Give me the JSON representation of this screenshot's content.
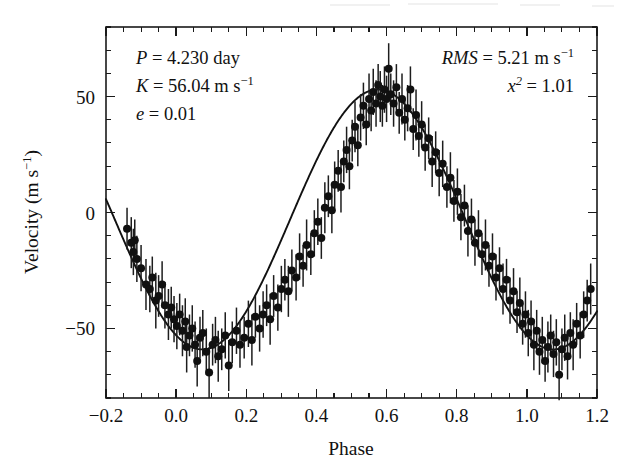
{
  "figure": {
    "background_color": "#ffffff",
    "ink_color": "#111111"
  },
  "annotations": {
    "left_block": [
      {
        "id": "period",
        "symbol": "P",
        "equals": "=",
        "value": "4.230",
        "unit": "day"
      },
      {
        "id": "semi-amplitude",
        "symbol": "K",
        "equals": "=",
        "value": "56.04",
        "unit": "m s",
        "unit_exp": "−1"
      },
      {
        "id": "eccentricity",
        "symbol": "e",
        "equals": "=",
        "value": "0.01",
        "unit": ""
      }
    ],
    "right_block": [
      {
        "id": "rms",
        "symbol": "RMS",
        "equals": "=",
        "value": "5.21",
        "unit": "m s",
        "unit_exp": "−1"
      },
      {
        "id": "chi-squared",
        "symbol": "x",
        "symbol_exp": "2",
        "equals": "=",
        "value": "1.01",
        "unit": ""
      }
    ],
    "left_lines_plain": [
      "P = 4.230 day",
      "K = 56.04 m s⁻¹",
      "e = 0.01"
    ],
    "right_lines_plain": [
      "RMS = 5.21 m s⁻¹",
      "x² = 1.01"
    ]
  },
  "chart_data": {
    "type": "scatter",
    "title": "",
    "subtitle": "",
    "xlabel": "Phase",
    "ylabel": "Velocity (m s⁻¹)",
    "ylabel_plain": "Velocity (m s-1)",
    "xlim": [
      -0.2,
      1.2
    ],
    "ylim": [
      -80,
      80
    ],
    "grid": false,
    "legend": "none",
    "x_major_ticks": [
      -0.2,
      0.0,
      0.2,
      0.4,
      0.6,
      0.8,
      1.0,
      1.2
    ],
    "x_major_ticklabels": [
      "−0.2",
      "0.0",
      "0.2",
      "0.4",
      "0.6",
      "0.8",
      "1.0",
      "1.2"
    ],
    "x_minor_step": 0.05,
    "y_major_ticks": [
      -50,
      0,
      50
    ],
    "y_major_ticklabels": [
      "−50",
      "0",
      "50"
    ],
    "y_minor_step": 10,
    "tick_direction": "in",
    "marker": "filled-circle",
    "marker_size_px": 8,
    "errorbars": "vertical",
    "model": {
      "name": "keplerian-fit",
      "form": "sinusoid",
      "period": 1.0,
      "amplitude": 56.04,
      "offset": -3.0,
      "phase_of_max": 0.575,
      "eccentricity": 0.01
    },
    "series": [
      {
        "name": "radial velocity",
        "points": [
          {
            "x": -0.14,
            "y": -7,
            "e": 9
          },
          {
            "x": -0.128,
            "y": -13,
            "e": 11
          },
          {
            "x": -0.122,
            "y": -17,
            "e": 10
          },
          {
            "x": -0.118,
            "y": -12,
            "e": 9
          },
          {
            "x": -0.112,
            "y": -20,
            "e": 10
          },
          {
            "x": -0.1,
            "y": -24,
            "e": 10
          },
          {
            "x": -0.086,
            "y": -31,
            "e": 11
          },
          {
            "x": -0.075,
            "y": -33,
            "e": 10
          },
          {
            "x": -0.068,
            "y": -28,
            "e": 9
          },
          {
            "x": -0.058,
            "y": -38,
            "e": 12
          },
          {
            "x": -0.05,
            "y": -36,
            "e": 9
          },
          {
            "x": -0.04,
            "y": -31,
            "e": 10
          },
          {
            "x": -0.032,
            "y": -40,
            "e": 10
          },
          {
            "x": -0.022,
            "y": -44,
            "e": 11
          },
          {
            "x": -0.014,
            "y": -41,
            "e": 9
          },
          {
            "x": -0.006,
            "y": -46,
            "e": 10
          },
          {
            "x": 0.002,
            "y": -49,
            "e": 10
          },
          {
            "x": 0.01,
            "y": -44,
            "e": 9
          },
          {
            "x": 0.018,
            "y": -51,
            "e": 11
          },
          {
            "x": 0.026,
            "y": -47,
            "e": 10
          },
          {
            "x": 0.03,
            "y": -58,
            "e": 11
          },
          {
            "x": 0.038,
            "y": -53,
            "e": 9
          },
          {
            "x": 0.046,
            "y": -50,
            "e": 10
          },
          {
            "x": 0.054,
            "y": -57,
            "e": 10
          },
          {
            "x": 0.06,
            "y": -64,
            "e": 11
          },
          {
            "x": 0.068,
            "y": -54,
            "e": 9
          },
          {
            "x": 0.076,
            "y": -52,
            "e": 10
          },
          {
            "x": 0.086,
            "y": -60,
            "e": 10
          },
          {
            "x": 0.094,
            "y": -69,
            "e": 11
          },
          {
            "x": 0.104,
            "y": -57,
            "e": 9
          },
          {
            "x": 0.112,
            "y": -55,
            "e": 10
          },
          {
            "x": 0.12,
            "y": -62,
            "e": 11
          },
          {
            "x": 0.13,
            "y": -59,
            "e": 9
          },
          {
            "x": 0.14,
            "y": -53,
            "e": 10
          },
          {
            "x": 0.15,
            "y": -66,
            "e": 11
          },
          {
            "x": 0.16,
            "y": -56,
            "e": 9
          },
          {
            "x": 0.172,
            "y": -51,
            "e": 10
          },
          {
            "x": 0.182,
            "y": -57,
            "e": 10
          },
          {
            "x": 0.194,
            "y": -54,
            "e": 9
          },
          {
            "x": 0.206,
            "y": -48,
            "e": 10
          },
          {
            "x": 0.216,
            "y": -55,
            "e": 11
          },
          {
            "x": 0.226,
            "y": -45,
            "e": 9
          },
          {
            "x": 0.238,
            "y": -50,
            "e": 10
          },
          {
            "x": 0.248,
            "y": -44,
            "e": 10
          },
          {
            "x": 0.258,
            "y": -40,
            "e": 9
          },
          {
            "x": 0.268,
            "y": -46,
            "e": 11
          },
          {
            "x": 0.278,
            "y": -36,
            "e": 9
          },
          {
            "x": 0.29,
            "y": -41,
            "e": 10
          },
          {
            "x": 0.3,
            "y": -33,
            "e": 10
          },
          {
            "x": 0.31,
            "y": -29,
            "e": 9
          },
          {
            "x": 0.32,
            "y": -34,
            "e": 11
          },
          {
            "x": 0.33,
            "y": -25,
            "e": 9
          },
          {
            "x": 0.342,
            "y": -28,
            "e": 10
          },
          {
            "x": 0.352,
            "y": -19,
            "e": 10
          },
          {
            "x": 0.362,
            "y": -23,
            "e": 9
          },
          {
            "x": 0.372,
            "y": -14,
            "e": 11
          },
          {
            "x": 0.384,
            "y": -18,
            "e": 9
          },
          {
            "x": 0.394,
            "y": -9,
            "e": 10
          },
          {
            "x": 0.404,
            "y": -4,
            "e": 10
          },
          {
            "x": 0.414,
            "y": -11,
            "e": 9
          },
          {
            "x": 0.424,
            "y": 2,
            "e": 11
          },
          {
            "x": 0.434,
            "y": 7,
            "e": 9
          },
          {
            "x": 0.444,
            "y": 1,
            "e": 10
          },
          {
            "x": 0.452,
            "y": 12,
            "e": 10
          },
          {
            "x": 0.462,
            "y": 18,
            "e": 9
          },
          {
            "x": 0.47,
            "y": 11,
            "e": 11
          },
          {
            "x": 0.478,
            "y": 22,
            "e": 9
          },
          {
            "x": 0.486,
            "y": 27,
            "e": 10
          },
          {
            "x": 0.494,
            "y": 20,
            "e": 10
          },
          {
            "x": 0.502,
            "y": 31,
            "e": 9
          },
          {
            "x": 0.51,
            "y": 37,
            "e": 11
          },
          {
            "x": 0.518,
            "y": 29,
            "e": 9
          },
          {
            "x": 0.526,
            "y": 41,
            "e": 10
          },
          {
            "x": 0.534,
            "y": 46,
            "e": 10
          },
          {
            "x": 0.542,
            "y": 38,
            "e": 9
          },
          {
            "x": 0.55,
            "y": 49,
            "e": 11
          },
          {
            "x": 0.556,
            "y": 44,
            "e": 9
          },
          {
            "x": 0.562,
            "y": 52,
            "e": 10
          },
          {
            "x": 0.57,
            "y": 47,
            "e": 10
          },
          {
            "x": 0.576,
            "y": 55,
            "e": 9
          },
          {
            "x": 0.582,
            "y": 50,
            "e": 11
          },
          {
            "x": 0.588,
            "y": 46,
            "e": 9
          },
          {
            "x": 0.594,
            "y": 53,
            "e": 10
          },
          {
            "x": 0.6,
            "y": 49,
            "e": 10
          },
          {
            "x": 0.606,
            "y": 62,
            "e": 11
          },
          {
            "x": 0.612,
            "y": 51,
            "e": 9
          },
          {
            "x": 0.62,
            "y": 47,
            "e": 10
          },
          {
            "x": 0.628,
            "y": 54,
            "e": 10
          },
          {
            "x": 0.636,
            "y": 43,
            "e": 9
          },
          {
            "x": 0.644,
            "y": 49,
            "e": 11
          },
          {
            "x": 0.652,
            "y": 40,
            "e": 9
          },
          {
            "x": 0.66,
            "y": 45,
            "e": 10
          },
          {
            "x": 0.668,
            "y": 53,
            "e": 10
          },
          {
            "x": 0.676,
            "y": 36,
            "e": 9
          },
          {
            "x": 0.684,
            "y": 42,
            "e": 11
          },
          {
            "x": 0.692,
            "y": 33,
            "e": 9
          },
          {
            "x": 0.7,
            "y": 38,
            "e": 10
          },
          {
            "x": 0.71,
            "y": 28,
            "e": 10
          },
          {
            "x": 0.72,
            "y": 32,
            "e": 9
          },
          {
            "x": 0.73,
            "y": 22,
            "e": 11
          },
          {
            "x": 0.74,
            "y": 26,
            "e": 9
          },
          {
            "x": 0.75,
            "y": 17,
            "e": 10
          },
          {
            "x": 0.76,
            "y": 21,
            "e": 10
          },
          {
            "x": 0.772,
            "y": 11,
            "e": 9
          },
          {
            "x": 0.782,
            "y": 15,
            "e": 11
          },
          {
            "x": 0.792,
            "y": 5,
            "e": 9
          },
          {
            "x": 0.802,
            "y": 9,
            "e": 10
          },
          {
            "x": 0.812,
            "y": -2,
            "e": 10
          },
          {
            "x": 0.822,
            "y": 3,
            "e": 9
          },
          {
            "x": 0.832,
            "y": -8,
            "e": 11
          },
          {
            "x": 0.842,
            "y": -3,
            "e": 9
          },
          {
            "x": 0.852,
            "y": -13,
            "e": 10
          },
          {
            "x": 0.862,
            "y": -9,
            "e": 10
          },
          {
            "x": 0.872,
            "y": -18,
            "e": 9
          },
          {
            "x": 0.882,
            "y": -14,
            "e": 11
          },
          {
            "x": 0.892,
            "y": -23,
            "e": 9
          },
          {
            "x": 0.902,
            "y": -19,
            "e": 10
          },
          {
            "x": 0.912,
            "y": -28,
            "e": 10
          },
          {
            "x": 0.922,
            "y": -24,
            "e": 9
          },
          {
            "x": 0.932,
            "y": -33,
            "e": 11
          },
          {
            "x": 0.942,
            "y": -29,
            "e": 9
          },
          {
            "x": 0.952,
            "y": -38,
            "e": 10
          },
          {
            "x": 0.962,
            "y": -34,
            "e": 10
          },
          {
            "x": 0.972,
            "y": -43,
            "e": 9
          },
          {
            "x": 0.98,
            "y": -39,
            "e": 11
          },
          {
            "x": 0.988,
            "y": -48,
            "e": 9
          },
          {
            "x": 0.996,
            "y": -44,
            "e": 10
          },
          {
            "x": 1.004,
            "y": -52,
            "e": 10
          },
          {
            "x": 1.012,
            "y": -47,
            "e": 9
          },
          {
            "x": 1.02,
            "y": -57,
            "e": 11
          },
          {
            "x": 1.028,
            "y": -51,
            "e": 9
          },
          {
            "x": 1.036,
            "y": -60,
            "e": 10
          },
          {
            "x": 1.044,
            "y": -55,
            "e": 10
          },
          {
            "x": 1.052,
            "y": -64,
            "e": 9
          },
          {
            "x": 1.06,
            "y": -58,
            "e": 11
          },
          {
            "x": 1.068,
            "y": -53,
            "e": 9
          },
          {
            "x": 1.076,
            "y": -61,
            "e": 10
          },
          {
            "x": 1.084,
            "y": -56,
            "e": 10
          },
          {
            "x": 1.092,
            "y": -70,
            "e": 11
          },
          {
            "x": 1.1,
            "y": -59,
            "e": 9
          },
          {
            "x": 1.108,
            "y": -54,
            "e": 10
          },
          {
            "x": 1.116,
            "y": -62,
            "e": 10
          },
          {
            "x": 1.124,
            "y": -52,
            "e": 9
          },
          {
            "x": 1.132,
            "y": -57,
            "e": 11
          },
          {
            "x": 1.142,
            "y": -48,
            "e": 9
          },
          {
            "x": 1.152,
            "y": -53,
            "e": 10
          },
          {
            "x": 1.162,
            "y": -44,
            "e": 10
          },
          {
            "x": 1.172,
            "y": -38,
            "e": 9
          },
          {
            "x": 1.182,
            "y": -33,
            "e": 11
          }
        ]
      }
    ]
  }
}
